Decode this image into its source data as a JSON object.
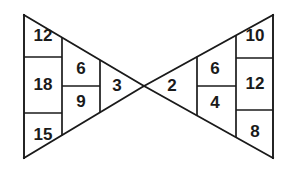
{
  "figure": {
    "name": "bowtie-number-diagram",
    "background_color": "#ffffff",
    "line_color": "#1a1a1a",
    "text_color": "#1a1a1a",
    "left_triangle": {
      "name": "left-triangle",
      "orientation": "apex-right",
      "columns": [
        {
          "name": "left-outer-column",
          "cells": [
            {
              "label": "12"
            },
            {
              "label": "18"
            },
            {
              "label": "15"
            }
          ]
        },
        {
          "name": "left-middle-column",
          "cells": [
            {
              "label": "6"
            },
            {
              "label": "9"
            }
          ]
        },
        {
          "name": "left-apex-column",
          "cells": [
            {
              "label": "3"
            }
          ]
        }
      ]
    },
    "right_triangle": {
      "name": "right-triangle",
      "orientation": "apex-left",
      "columns": [
        {
          "name": "right-apex-column",
          "cells": [
            {
              "label": "2"
            }
          ]
        },
        {
          "name": "right-middle-column",
          "cells": [
            {
              "label": "6"
            },
            {
              "label": "4"
            }
          ]
        },
        {
          "name": "right-outer-column",
          "cells": [
            {
              "label": "10"
            },
            {
              "label": "12"
            },
            {
              "label": "8"
            }
          ]
        }
      ]
    }
  }
}
